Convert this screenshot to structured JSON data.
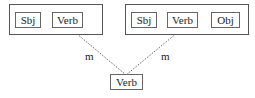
{
  "diagram": {
    "left_group": {
      "nodes": [
        {
          "label": "Sbj"
        },
        {
          "label": "Verb"
        }
      ]
    },
    "right_group": {
      "nodes": [
        {
          "label": "Sbj"
        },
        {
          "label": "Verb"
        },
        {
          "label": "Obj"
        }
      ]
    },
    "bottom_node": {
      "label": "Verb"
    },
    "edges": [
      {
        "from": "left_group.Verb",
        "to": "bottom_node",
        "label": "m",
        "style": "dotted"
      },
      {
        "from": "right_group.Verb",
        "to": "bottom_node",
        "label": "m",
        "style": "dotted"
      }
    ],
    "colors": {
      "border": "#555555",
      "line": "#666666",
      "text": "#222222"
    }
  }
}
